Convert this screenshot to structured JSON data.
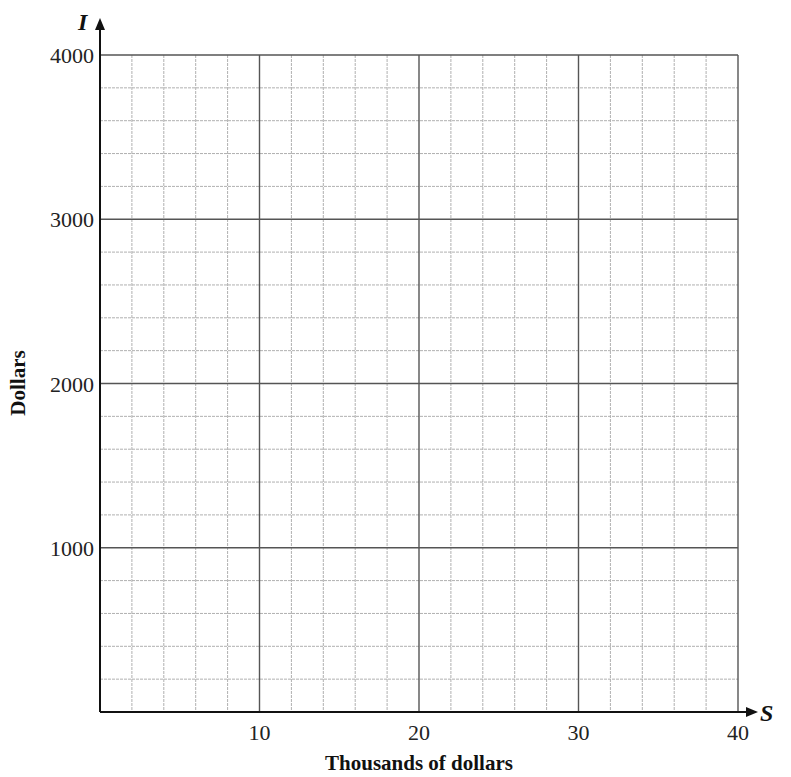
{
  "chart_data": {
    "type": "line",
    "title": "",
    "xlabel": "Thousands of dollars",
    "ylabel": "Dollars",
    "x_variable": "S",
    "y_variable": "I",
    "xlim": [
      0,
      40
    ],
    "ylim": [
      0,
      4000
    ],
    "x_ticks": [
      10,
      20,
      30,
      40
    ],
    "x_tick_labels": [
      "10",
      "20",
      "30",
      "40"
    ],
    "y_ticks": [
      1000,
      2000,
      3000,
      4000
    ],
    "y_tick_labels": [
      "1000",
      "2000",
      "3000",
      "4000"
    ],
    "x_minor_step": 2,
    "y_minor_step": 200,
    "grid": true,
    "legend": null,
    "series": []
  },
  "layout": {
    "origin_px": [
      100,
      712
    ],
    "x_max_px": 738,
    "y_max_px": 55
  },
  "colors": {
    "axis": "#111111",
    "major_grid": "#555555",
    "minor_grid": "#b0b0b0",
    "background": "#ffffff"
  }
}
